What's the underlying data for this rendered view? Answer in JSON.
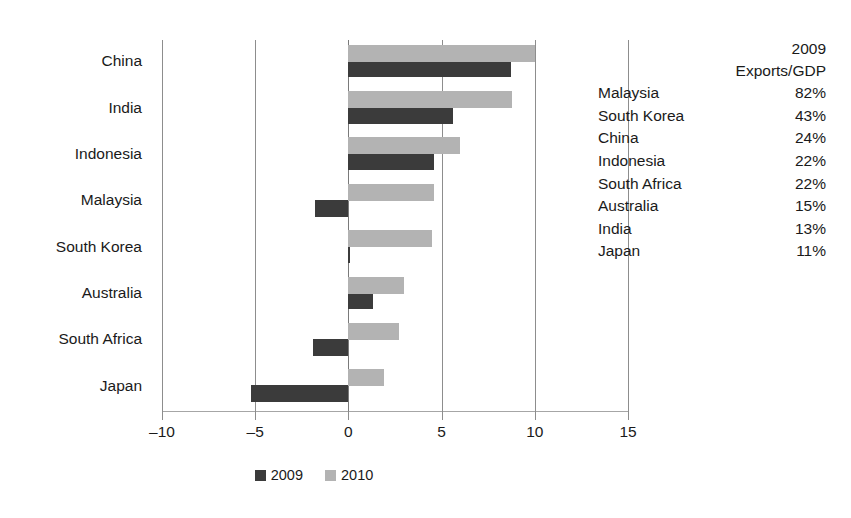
{
  "chart_data": {
    "type": "bar",
    "orientation": "horizontal",
    "title": "",
    "xlabel": "",
    "ylabel": "",
    "xlim": [
      -10,
      15
    ],
    "xticks": [
      -10,
      -5,
      0,
      5,
      10,
      15
    ],
    "xtick_labels": [
      "–10",
      "–5",
      "0",
      "5",
      "10",
      "15"
    ],
    "grid": true,
    "legend_position": "bottom",
    "categories": [
      "China",
      "India",
      "Indonesia",
      "Malaysia",
      "South Korea",
      "Australia",
      "South Africa",
      "Japan"
    ],
    "series": [
      {
        "name": "2009",
        "color": "#3b3b3b",
        "values": [
          8.7,
          5.6,
          4.6,
          -1.8,
          0.1,
          1.3,
          -1.9,
          -5.2
        ]
      },
      {
        "name": "2010",
        "color": "#b3b3b3",
        "values": [
          10.0,
          8.8,
          6.0,
          4.6,
          4.5,
          3.0,
          2.7,
          1.9
        ]
      }
    ]
  },
  "legend": {
    "items": [
      {
        "label": "2009",
        "color": "#3b3b3b"
      },
      {
        "label": "2010",
        "color": "#b3b3b3"
      }
    ]
  },
  "side_table": {
    "header_line1": "2009",
    "header_line2": "Exports/GDP",
    "rows": [
      {
        "country": "Malaysia",
        "value": "82%"
      },
      {
        "country": "South Korea",
        "value": "43%"
      },
      {
        "country": "China",
        "value": "24%"
      },
      {
        "country": "Indonesia",
        "value": "22%"
      },
      {
        "country": "South Africa",
        "value": "22%"
      },
      {
        "country": "Australia",
        "value": "15%"
      },
      {
        "country": "India",
        "value": "13%"
      },
      {
        "country": "Japan",
        "value": "11%"
      }
    ]
  }
}
